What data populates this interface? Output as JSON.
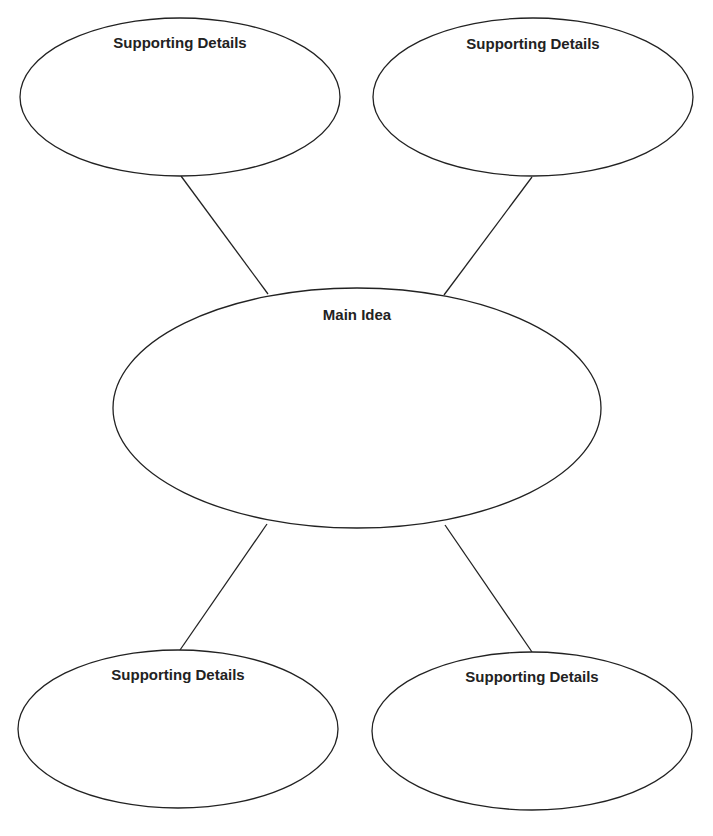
{
  "diagram": {
    "type": "main-idea-web",
    "main": {
      "label": "Main Idea",
      "cx": 357,
      "cy": 408,
      "rx": 244,
      "ry": 120,
      "label_y": 308
    },
    "details": [
      {
        "label": "Supporting Details",
        "cx": 180,
        "cy": 97,
        "rx": 160,
        "ry": 79,
        "label_y": 36
      },
      {
        "label": "Supporting Details",
        "cx": 533,
        "cy": 97,
        "rx": 160,
        "ry": 79,
        "label_y": 37
      },
      {
        "label": "Supporting Details",
        "cx": 178,
        "cy": 729,
        "rx": 160,
        "ry": 79,
        "label_y": 668
      },
      {
        "label": "Supporting Details",
        "cx": 532,
        "cy": 731,
        "rx": 160,
        "ry": 79,
        "label_y": 670
      }
    ],
    "connectors": [
      {
        "x1": 181,
        "y1": 176,
        "x2": 268,
        "y2": 294
      },
      {
        "x1": 532,
        "y1": 177,
        "x2": 444,
        "y2": 295
      },
      {
        "x1": 267,
        "y1": 524,
        "x2": 180,
        "y2": 650
      },
      {
        "x1": 445,
        "y1": 525,
        "x2": 532,
        "y2": 652
      }
    ],
    "stroke_color": "#222222"
  }
}
